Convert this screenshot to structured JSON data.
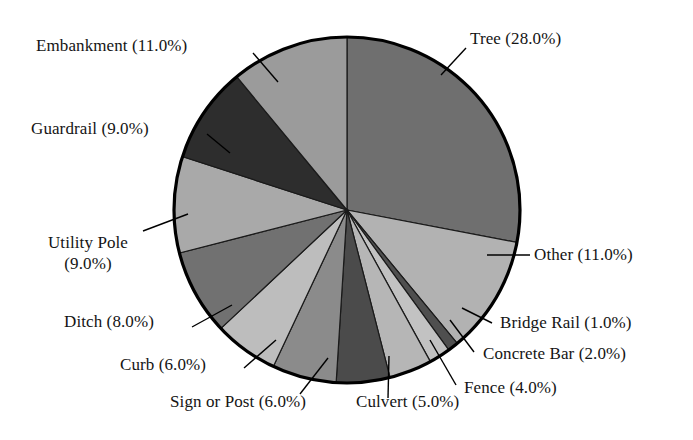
{
  "chart_data": {
    "type": "pie",
    "title": "",
    "subtitle": "",
    "xlabel": "",
    "ylabel": "",
    "legend_position": "none",
    "grid": false,
    "labels_show_percent": true,
    "start_angle_deg": 90,
    "direction": "clockwise",
    "categories": [
      "Tree",
      "Other",
      "Bridge Rail",
      "Concrete Bar",
      "Fence",
      "Culvert",
      "Sign or Post",
      "Curb",
      "Ditch",
      "Utility Pole",
      "Guardrail",
      "Embankment"
    ],
    "values": [
      28.0,
      11.0,
      1.0,
      2.0,
      4.0,
      5.0,
      6.0,
      6.0,
      8.0,
      9.0,
      9.0,
      11.0
    ],
    "units": "percent",
    "total": 100.0,
    "slices": [
      {
        "name": "Tree",
        "value": 28.0,
        "label": "Tree (28.0%)",
        "color": "#6f6f6f"
      },
      {
        "name": "Other",
        "value": 11.0,
        "label": "Other (11.0%)",
        "color": "#b2b2b2"
      },
      {
        "name": "Bridge Rail",
        "value": 1.0,
        "label": "Bridge Rail (1.0%)",
        "color": "#4f4f4f"
      },
      {
        "name": "Concrete Bar",
        "value": 2.0,
        "label": "Concrete Bar (2.0%)",
        "color": "#c2c2c2"
      },
      {
        "name": "Fence",
        "value": 4.0,
        "label": "Fence (4.0%)",
        "color": "#b6b6b6"
      },
      {
        "name": "Culvert",
        "value": 5.0,
        "label": "Culvert (5.0%)",
        "color": "#4b4b4b"
      },
      {
        "name": "Sign or Post",
        "value": 6.0,
        "label": "Sign or Post (6.0%)",
        "color": "#8b8b8b"
      },
      {
        "name": "Curb",
        "value": 6.0,
        "label": "Curb (6.0%)",
        "color": "#bdbdbd"
      },
      {
        "name": "Ditch",
        "value": 8.0,
        "label": "Ditch (8.0%)",
        "color": "#717171"
      },
      {
        "name": "Utility Pole",
        "value": 9.0,
        "label": "Utility Pole (9.0%)",
        "color": "#a9a9a9"
      },
      {
        "name": "Guardrail",
        "value": 9.0,
        "label": "Guardrail (9.0%)",
        "color": "#2d2d2d"
      },
      {
        "name": "Embankment",
        "value": 11.0,
        "label": "Embankment (11.0%)",
        "color": "#9b9b9b"
      }
    ]
  },
  "labels": {
    "tree": "Tree (28.0%)",
    "other": "Other (11.0%)",
    "bridge_rail": "Bridge Rail (1.0%)",
    "concrete_bar": "Concrete Bar (2.0%)",
    "fence": "Fence (4.0%)",
    "culvert": "Culvert (5.0%)",
    "sign_or_post": "Sign or Post (6.0%)",
    "curb": "Curb (6.0%)",
    "ditch": "Ditch (8.0%)",
    "utility_pole_line1": "Utility Pole",
    "utility_pole_line2": "(9.0%)",
    "guardrail": "Guardrail (9.0%)",
    "embankment": "Embankment (11.0%)"
  },
  "style": {
    "background": "#ffffff",
    "outline_color": "#000000",
    "text_color": "#141414",
    "leader_line_color": "#000000"
  }
}
